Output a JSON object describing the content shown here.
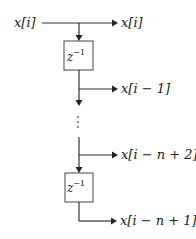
{
  "diagram": {
    "input_label": "x[i]",
    "outputs": [
      {
        "label": "x[i]"
      },
      {
        "label": "x[i − 1]"
      },
      {
        "label": "x[i − n + 2]"
      },
      {
        "label": "x[i − n + 1]"
      }
    ],
    "blocks": [
      {
        "base": "z",
        "exponent": "−1"
      },
      {
        "base": "z",
        "exponent": "−1"
      }
    ],
    "ellipsis": "⋮",
    "colors": {
      "line": "#333333",
      "text": "#222222",
      "box_border": "#444444"
    }
  }
}
